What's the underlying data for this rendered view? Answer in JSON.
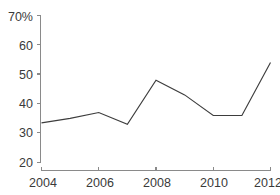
{
  "chart_data": {
    "type": "line",
    "title": "",
    "subtitle": "",
    "xlabel": "",
    "ylabel": "",
    "x": [
      2004,
      2005,
      2006,
      2007,
      2008,
      2009,
      2010,
      2011,
      2012
    ],
    "values": [
      33.5,
      35,
      37,
      33,
      48,
      43,
      36,
      36,
      54
    ],
    "series": [
      {
        "name": "",
        "values": [
          33.5,
          35,
          37,
          33,
          48,
          43,
          36,
          36,
          54
        ]
      }
    ],
    "xlim": [
      2004,
      2012
    ],
    "ylim": [
      20,
      70
    ],
    "grid": false,
    "legend": false,
    "legend_position": "none",
    "y_ticks": [
      {
        "value": 70,
        "label": "70%"
      },
      {
        "value": 60,
        "label": "60"
      },
      {
        "value": 50,
        "label": "50"
      },
      {
        "value": 40,
        "label": "40"
      },
      {
        "value": 30,
        "label": "30"
      },
      {
        "value": 20,
        "label": "20"
      }
    ],
    "x_ticks": [
      {
        "value": 2004,
        "label": "2004"
      },
      {
        "value": 2006,
        "label": "2006"
      },
      {
        "value": 2008,
        "label": "2008"
      },
      {
        "value": 2010,
        "label": "2010"
      },
      {
        "value": 2012,
        "label": "2012"
      }
    ],
    "colors": {
      "line": "#3d3d3d",
      "axis": "#8a8a8a",
      "text": "#3a3a3a",
      "background": "#ffffff"
    }
  }
}
